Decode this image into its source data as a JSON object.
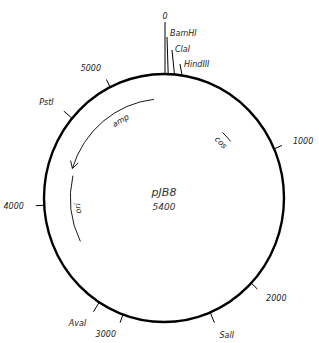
{
  "plasmid": {
    "name": "pJB8",
    "size_label": "5400",
    "total_bp": 5400
  },
  "scale_ticks": [
    {
      "label": "0",
      "bp": 0
    },
    {
      "label": "1000",
      "bp": 1000
    },
    {
      "label": "2000",
      "bp": 2000
    },
    {
      "label": "3000",
      "bp": 3000
    },
    {
      "label": "4000",
      "bp": 4000
    },
    {
      "label": "5000",
      "bp": 5000
    }
  ],
  "restriction_sites": [
    {
      "label": "BamHI",
      "bp": 30
    },
    {
      "label": "ClaI",
      "bp": 75
    },
    {
      "label": "HindIII",
      "bp": 130
    },
    {
      "label": "SalI",
      "bp": 2360
    },
    {
      "label": "AvaI",
      "bp": 3190
    },
    {
      "label": "PstI",
      "bp": 4650
    }
  ],
  "features": [
    {
      "label": "amp",
      "start_bp": 5310,
      "end_bp": 4310,
      "direction": "counterclockwise",
      "arrow": true
    },
    {
      "label": "cos",
      "start_bp": 640,
      "end_bp": 760,
      "arrow": false
    },
    {
      "label": "ori",
      "start_bp": 3650,
      "end_bp": 4250,
      "arrow": false
    }
  ],
  "colors": {
    "line": "#000000",
    "text": "#222222"
  }
}
